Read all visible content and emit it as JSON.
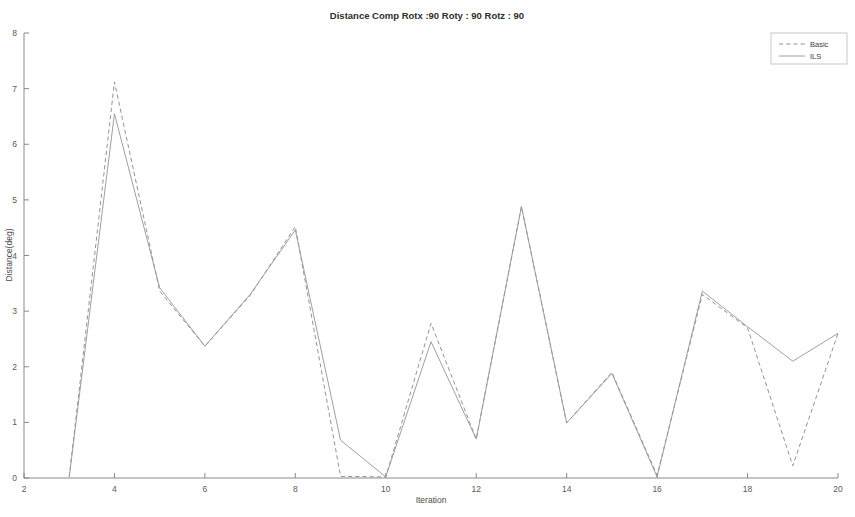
{
  "chart_data": {
    "type": "line",
    "title": "Distance Comp  Rotx :90 Roty : 90 Rotz : 90",
    "xlabel": "Iteration",
    "ylabel": "Distance(deg)",
    "xlim": [
      2,
      20
    ],
    "ylim": [
      0,
      8
    ],
    "xticks": [
      2,
      4,
      6,
      8,
      10,
      12,
      14,
      16,
      18,
      20
    ],
    "yticks": [
      0,
      1,
      2,
      3,
      4,
      5,
      6,
      7,
      8
    ],
    "xtick_labels": [
      "2",
      "4",
      "6",
      "8",
      "10",
      "12",
      "14",
      "16",
      "18",
      "20"
    ],
    "ytick_labels": [
      "0",
      "1",
      "2",
      "3",
      "4",
      "5",
      "6",
      "7",
      "8"
    ],
    "grid": false,
    "legend_position": "top-right",
    "x": [
      3,
      4,
      5,
      6,
      7,
      8,
      9,
      10,
      11,
      12,
      13,
      14,
      15,
      16,
      17,
      18,
      19,
      20
    ],
    "series": [
      {
        "name": "Basic",
        "style": "dashed",
        "color": "#8d8d8d",
        "values": [
          0.02,
          7.12,
          3.36,
          2.37,
          3.28,
          4.52,
          0.03,
          0.02,
          2.78,
          0.7,
          4.88,
          0.99,
          1.9,
          0.05,
          3.3,
          2.7,
          0.22,
          2.6
        ]
      },
      {
        "name": "ILS",
        "style": "solid",
        "color": "#9a9a9a",
        "values": [
          0.02,
          6.55,
          3.42,
          2.37,
          3.3,
          4.46,
          0.68,
          0.02,
          2.45,
          0.7,
          4.88,
          0.99,
          1.88,
          0.02,
          3.36,
          2.72,
          2.1,
          2.6
        ]
      }
    ]
  },
  "legend": {
    "entries": [
      {
        "label": "Basic"
      },
      {
        "label": "ILS"
      }
    ]
  }
}
